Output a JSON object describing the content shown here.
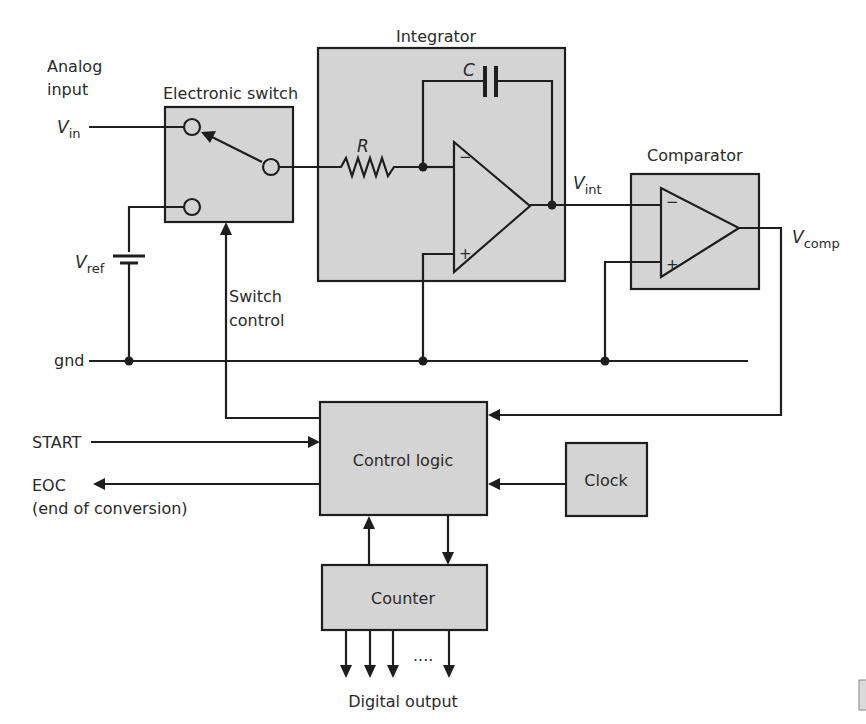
{
  "blocks": {
    "electronic_switch": {
      "label": "Electronic switch"
    },
    "integrator": {
      "label": "Integrator",
      "resistor": "R",
      "capacitor": "C"
    },
    "comparator": {
      "label": "Comparator"
    },
    "control_logic": {
      "label": "Control logic"
    },
    "clock": {
      "label": "Clock"
    },
    "counter": {
      "label": "Counter"
    }
  },
  "signals": {
    "analog_input": {
      "line1": "Analog",
      "line2": "input"
    },
    "vin": {
      "main": "V",
      "sub": "in"
    },
    "vref": {
      "main": "V",
      "sub": "ref"
    },
    "vint": {
      "main": "V",
      "sub": "int"
    },
    "vcomp": {
      "main": "V",
      "sub": "comp"
    },
    "gnd": "gnd",
    "switch_control": {
      "line1": "Switch",
      "line2": "control"
    },
    "start": "START",
    "eoc": {
      "line1": "EOC",
      "line2": "(end of conversion)"
    },
    "digital_output": "Digital output",
    "ellipsis": "...."
  },
  "opamp_signs": {
    "minus": "−",
    "plus": "+"
  },
  "colors": {
    "block_fill": "#d4d4d4",
    "line": "#1e1e1e",
    "text": "#2a2a2a"
  }
}
